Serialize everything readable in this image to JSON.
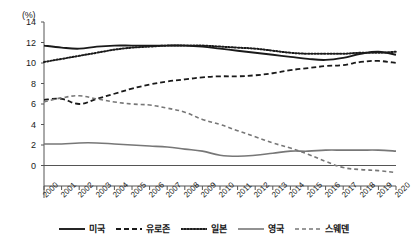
{
  "chart_data": {
    "type": "line",
    "title": "",
    "xlabel": "",
    "ylabel": "(%)",
    "unit_label": "(%)",
    "grid": false,
    "legend_position": "bottom",
    "xlim": [
      2000,
      2020
    ],
    "ylim": [
      -2,
      14
    ],
    "yticks": [
      0,
      2,
      4,
      6,
      8,
      10,
      12,
      14
    ],
    "ytick_labels": [
      "0",
      "2",
      "4",
      "6",
      "8",
      "10",
      "12",
      "14"
    ],
    "categories": [
      "2000",
      "2001",
      "2002",
      "2003",
      "2004",
      "2005",
      "2006",
      "2007",
      "2008",
      "2009",
      "2010",
      "2011",
      "2012",
      "2013",
      "2014",
      "2015",
      "2016",
      "2017",
      "2018",
      "2019",
      "2020"
    ],
    "series": [
      {
        "name": "미국",
        "style": "solid",
        "color": "#1a1a1a",
        "width": 1.9,
        "values": [
          11.7,
          11.5,
          11.4,
          11.6,
          11.7,
          11.7,
          11.7,
          11.7,
          11.7,
          11.6,
          11.4,
          11.2,
          11.0,
          10.8,
          10.6,
          10.4,
          10.3,
          10.5,
          10.9,
          11.1,
          10.8
        ]
      },
      {
        "name": "유로존",
        "style": "dashed",
        "color": "#1a1a1a",
        "width": 1.8,
        "values": [
          6.4,
          6.5,
          6.0,
          6.5,
          7.0,
          7.5,
          7.9,
          8.2,
          8.4,
          8.6,
          8.7,
          8.7,
          8.8,
          9.0,
          9.3,
          9.5,
          9.7,
          9.8,
          10.1,
          10.2,
          10.0
        ]
      },
      {
        "name": "일본",
        "style": "dotted",
        "color": "#1a1a1a",
        "width": 2.0,
        "values": [
          10.1,
          10.4,
          10.7,
          11.0,
          11.3,
          11.5,
          11.6,
          11.7,
          11.7,
          11.7,
          11.6,
          11.5,
          11.4,
          11.2,
          11.0,
          10.9,
          10.9,
          10.9,
          11.0,
          11.0,
          11.1
        ]
      },
      {
        "name": "영국",
        "style": "solid",
        "color": "#777777",
        "width": 1.6,
        "values": [
          2.1,
          2.1,
          2.2,
          2.2,
          2.1,
          2.0,
          1.9,
          1.8,
          1.6,
          1.4,
          1.0,
          0.9,
          1.0,
          1.2,
          1.4,
          1.4,
          1.5,
          1.5,
          1.5,
          1.5,
          1.4
        ]
      },
      {
        "name": "스웨덴",
        "style": "dashed",
        "color": "#777777",
        "width": 1.6,
        "values": [
          6.2,
          6.6,
          6.8,
          6.5,
          6.2,
          6.0,
          5.9,
          5.6,
          5.2,
          4.5,
          4.0,
          3.4,
          2.8,
          2.2,
          1.7,
          1.1,
          0.4,
          -0.2,
          -0.4,
          -0.5,
          -0.7
        ]
      }
    ]
  },
  "legend": {
    "items": [
      {
        "label": "미국",
        "style": "solid",
        "color": "#1a1a1a"
      },
      {
        "label": "유로존",
        "style": "dashed",
        "color": "#1a1a1a"
      },
      {
        "label": "일본",
        "style": "dotted",
        "color": "#1a1a1a"
      },
      {
        "label": "영국",
        "style": "solid",
        "color": "#777777"
      },
      {
        "label": "스웨덴",
        "style": "dashed",
        "color": "#777777"
      }
    ]
  },
  "colors": {
    "axis": "#555555",
    "text": "#1a1a1a",
    "dark_series": "#1a1a1a",
    "gray_series": "#777777",
    "background": "#ffffff"
  }
}
